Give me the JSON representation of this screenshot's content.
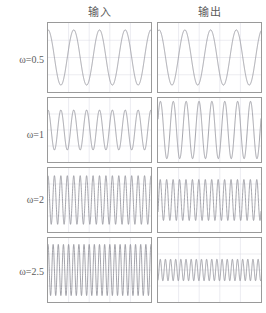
{
  "figure": {
    "title": "",
    "background_color": "#ffffff",
    "border_color": "#9a9a9a",
    "grid_color": "#d9d9e2",
    "trace_color": "#8d8d95"
  },
  "columns": [
    {
      "id": "input",
      "label": "输入"
    },
    {
      "id": "output",
      "label": "输出"
    }
  ],
  "rows": [
    {
      "id": "w0_5",
      "label": "ω=0.5"
    },
    {
      "id": "w1",
      "label": "ω=1"
    },
    {
      "id": "w2",
      "label": "ω=2"
    },
    {
      "id": "w2_5",
      "label": "ω=2.5"
    }
  ],
  "chart_data": {
    "type": "line",
    "title": "",
    "xlabel": "",
    "ylabel": "",
    "grid": true,
    "legend_position": "none",
    "panel_grid": {
      "x_divisions": 5,
      "y_divisions": 4
    },
    "panels": [
      {
        "row": "ω=0.5",
        "column": "输入",
        "omega": 0.5,
        "cycles": 4,
        "amplitude": 1.0,
        "phase": 1.57,
        "ylim": [
          -1.25,
          1.25
        ],
        "xlim": [
          0,
          50
        ]
      },
      {
        "row": "ω=0.5",
        "column": "输出",
        "omega": 0.5,
        "cycles": 4,
        "amplitude": 1.0,
        "phase": 1.3,
        "ylim": [
          -1.25,
          1.25
        ],
        "xlim": [
          0,
          50
        ]
      },
      {
        "row": "ω=1",
        "column": "输入",
        "omega": 1.0,
        "cycles": 8,
        "amplitude": 0.78,
        "phase": 1.57,
        "ylim": [
          -1.25,
          1.25
        ],
        "xlim": [
          0,
          50
        ]
      },
      {
        "row": "ω=1",
        "column": "输出",
        "omega": 1.0,
        "cycles": 8,
        "amplitude": 1.12,
        "phase": 0.4,
        "ylim": [
          -1.25,
          1.25
        ],
        "xlim": [
          0,
          50
        ]
      },
      {
        "row": "ω=2",
        "column": "输入",
        "omega": 2.0,
        "cycles": 16,
        "amplitude": 0.95,
        "phase": 1.57,
        "ylim": [
          -1.25,
          1.25
        ],
        "xlim": [
          0,
          50
        ]
      },
      {
        "row": "ω=2",
        "column": "输出",
        "omega": 2.0,
        "cycles": 16,
        "amplitude": 0.8,
        "phase": -0.6,
        "ylim": [
          -1.25,
          1.25
        ],
        "xlim": [
          0,
          50
        ]
      },
      {
        "row": "ω=2.5",
        "column": "输入",
        "omega": 2.5,
        "cycles": 20,
        "amplitude": 1.0,
        "phase": 1.57,
        "ylim": [
          -1.25,
          1.25
        ],
        "xlim": [
          0,
          50
        ]
      },
      {
        "row": "ω=2.5",
        "column": "输出",
        "omega": 2.5,
        "cycles": 20,
        "amplitude": 0.42,
        "phase": -1.2,
        "ylim": [
          -1.25,
          1.25
        ],
        "xlim": [
          0,
          50
        ]
      }
    ]
  },
  "geometry": {
    "columns_x": [
      47,
      157
    ],
    "panel_width": 105,
    "rows_y": [
      22,
      97,
      167,
      237
    ],
    "row_heights": [
      71,
      66,
      66,
      66
    ],
    "label_y": [
      54,
      129,
      194,
      266
    ]
  }
}
